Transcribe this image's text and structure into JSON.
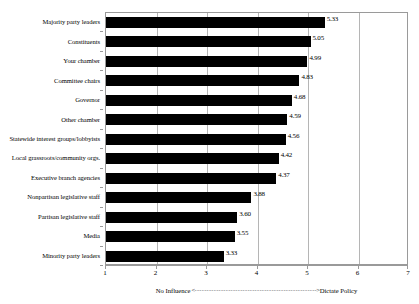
{
  "chart_data": {
    "type": "bar",
    "orientation": "horizontal",
    "title": "",
    "xlabel": "",
    "ylabel": "",
    "xlim": [
      1,
      7
    ],
    "xticks": [
      "1",
      "2",
      "3",
      "4",
      "5",
      "6",
      "7"
    ],
    "grid": "vertical",
    "legend": "none",
    "bar_color": "#000000",
    "categories": [
      "Majority party leaders",
      "Constituents",
      "Your chamber",
      "Committee chairs",
      "Governor",
      "Other chamber",
      "Statewide interest groups/lobbyists",
      "Local grassroots/community orgs.",
      "Executive branch agencies",
      "Nonpartisan legislative staff",
      "Partisan legislative staff",
      "Media",
      "Minority party leaders"
    ],
    "values": [
      5.33,
      5.05,
      4.99,
      4.83,
      4.68,
      4.59,
      4.56,
      4.42,
      4.37,
      3.88,
      3.6,
      3.55,
      3.33
    ],
    "value_labels": [
      "5.33",
      "5.05",
      "4.99",
      "4.83",
      "4.68",
      "4.59",
      "4.56",
      "4.42",
      "4.37",
      "3.88",
      "3.60",
      "3.55",
      "3.33"
    ],
    "axis_caption": {
      "left_text": "No Influence",
      "left_arrow": "<",
      "connector": "---------------------------------------------------",
      "right_arrow": ">",
      "right_text": "Dictate Policy"
    }
  }
}
